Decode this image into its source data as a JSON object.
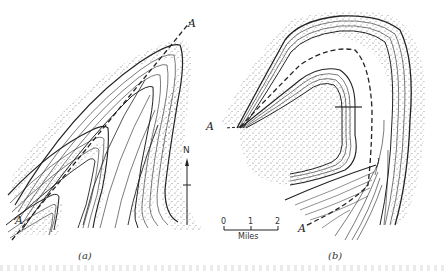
{
  "figure": {
    "panels": [
      {
        "id": "a",
        "caption": "(a)",
        "axis_labels": [
          "A",
          "A"
        ],
        "description": "Plunging fold outcrop pattern with nested V-shaped contours and stippled bed"
      },
      {
        "id": "b",
        "caption": "(b)",
        "axis_labels": [
          "A",
          "A"
        ],
        "description": "Curved (refolded) fold axis with bending contact bands and stippled bed"
      }
    ],
    "north_arrow": {
      "label": "N"
    },
    "scale_bar": {
      "ticks": [
        "0",
        "1",
        "2"
      ],
      "unit": "Miles"
    },
    "colors": {
      "ink": "#222222",
      "background": "#ffffff",
      "stipple": "#555555"
    }
  }
}
